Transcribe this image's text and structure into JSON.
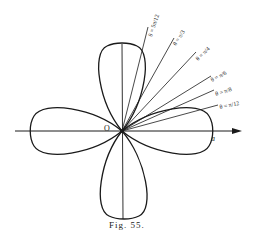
{
  "figure": {
    "caption": "Fig. 55.",
    "origin_label": "O",
    "axis_end_label": "a",
    "curve": "four-leaved rose r = a cos 2θ",
    "rays": [
      {
        "label": "θ = 5π/12",
        "num": "5π",
        "den": "12",
        "angle_deg": 75
      },
      {
        "label": "θ = π/3",
        "num": "π",
        "den": "3",
        "angle_deg": 60
      },
      {
        "label": "θ = π/4",
        "num": "π",
        "den": "4",
        "angle_deg": 45
      },
      {
        "label": "θ = π/6",
        "num": "π",
        "den": "6",
        "angle_deg": 30
      },
      {
        "label": "θ = π/8",
        "num": "π",
        "den": "8",
        "angle_deg": 22.5
      },
      {
        "label": "θ = π/12",
        "num": "π",
        "den": "12",
        "angle_deg": 15
      }
    ],
    "colors": {
      "ink": "#1a1a1a",
      "background": "#ffffff"
    }
  }
}
